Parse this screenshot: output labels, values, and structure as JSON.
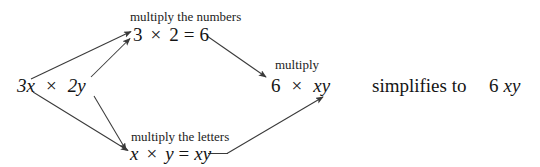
{
  "diagram": {
    "background_color": "#ffffff",
    "text_color": "#1a1a1a",
    "arrow_color": "#3a3a3a",
    "nodes": {
      "source_expression": {
        "coefficient_term": "3x",
        "times_symbol": "×",
        "second_term": "2y"
      },
      "numbers_caption": "multiply the numbers",
      "numbers_equation": {
        "left": "3",
        "times_symbol": "×",
        "right": "2",
        "equals": "=",
        "result": "6"
      },
      "letters_caption": "multiply the letters",
      "letters_equation": {
        "left": "x",
        "times_symbol": "×",
        "right": "y",
        "equals": "=",
        "result": "xy"
      },
      "multiply_caption": "multiply",
      "combined_expression": {
        "number": "6",
        "times_symbol": "×",
        "letters": "xy"
      },
      "simplifies_phrase": "simplifies to",
      "final_answer": {
        "number": "6",
        "letters": "xy"
      }
    },
    "arrows": [
      {
        "name": "from-3x-to-numbers",
        "from": "3x",
        "to": "3 × 2 = 6"
      },
      {
        "name": "from-2y-to-numbers",
        "from": "2y",
        "to": "3 × 2 = 6"
      },
      {
        "name": "from-3x-to-letters",
        "from": "3x",
        "to": "x × y = xy"
      },
      {
        "name": "from-2y-to-letters",
        "from": "2y",
        "to": "x × y = xy"
      },
      {
        "name": "from-numbers-to-combined",
        "from": "3 × 2 = 6",
        "to": "6"
      },
      {
        "name": "from-letters-to-combined",
        "from": "x × y = xy",
        "to": "xy"
      }
    ]
  }
}
